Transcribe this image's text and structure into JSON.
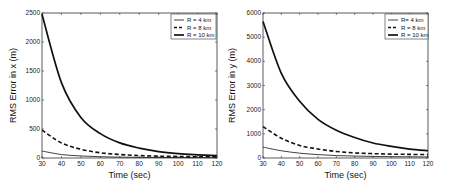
{
  "chart_data": [
    {
      "type": "line",
      "title": "",
      "xlabel": "Time (sec)",
      "ylabel": "RMS Error in x (m)",
      "xlim": [
        30,
        120
      ],
      "ylim": [
        0,
        2500
      ],
      "xticks": [
        30,
        40,
        50,
        60,
        70,
        80,
        90,
        100,
        110,
        120
      ],
      "yticks": [
        0,
        500,
        1000,
        1500,
        2000,
        2500
      ],
      "grid": false,
      "legend_position": "upper right",
      "x": [
        30,
        40,
        50,
        60,
        70,
        80,
        90,
        100,
        110,
        120
      ],
      "series": [
        {
          "name": "R = 4 km",
          "style": "thin-solid",
          "values": [
            120,
            60,
            35,
            22,
            15,
            11,
            9,
            8,
            7,
            6
          ]
        },
        {
          "name": "R = 8 km",
          "style": "dashed",
          "values": [
            480,
            260,
            150,
            90,
            60,
            42,
            32,
            26,
            22,
            20
          ]
        },
        {
          "name": "R = 10 km",
          "style": "thick-solid",
          "values": [
            2480,
            1300,
            700,
            420,
            260,
            170,
            110,
            75,
            55,
            40
          ]
        }
      ]
    },
    {
      "type": "line",
      "title": "",
      "xlabel": "Time (sec)",
      "ylabel": "RMS Error in y (m)",
      "xlim": [
        30,
        120
      ],
      "ylim": [
        0,
        6000
      ],
      "xticks": [
        30,
        40,
        50,
        60,
        70,
        80,
        90,
        100,
        110,
        120
      ],
      "yticks": [
        0,
        1000,
        2000,
        3000,
        4000,
        5000,
        6000
      ],
      "grid": false,
      "legend_position": "upper right",
      "x": [
        30,
        40,
        50,
        60,
        70,
        80,
        90,
        100,
        110,
        120
      ],
      "series": [
        {
          "name": "R= 4 km",
          "style": "thin-solid",
          "values": [
            450,
            300,
            200,
            140,
            100,
            80,
            65,
            55,
            50,
            45
          ]
        },
        {
          "name": "R = 8 km",
          "style": "dashed",
          "values": [
            1300,
            820,
            520,
            370,
            270,
            210,
            180,
            160,
            150,
            140
          ]
        },
        {
          "name": "R = 10 km",
          "style": "thick-solid",
          "values": [
            5650,
            3500,
            2350,
            1600,
            1150,
            850,
            620,
            480,
            370,
            300
          ]
        }
      ]
    }
  ]
}
